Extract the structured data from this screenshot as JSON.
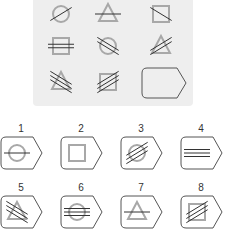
{
  "puzzle": {
    "type": "matrix-reasoning",
    "grid": [
      {
        "shape": "circle",
        "lines": 1,
        "angle": "diagonal-up"
      },
      {
        "shape": "triangle",
        "lines": 1,
        "angle": "horizontal"
      },
      {
        "shape": "square",
        "lines": 1,
        "angle": "diagonal-down"
      },
      {
        "shape": "square",
        "lines": 2,
        "angle": "horizontal"
      },
      {
        "shape": "circle",
        "lines": 2,
        "angle": "diagonal-down"
      },
      {
        "shape": "triangle",
        "lines": 2,
        "angle": "diagonal-up"
      },
      {
        "shape": "triangle",
        "lines": 3,
        "angle": "diagonal-down"
      },
      {
        "shape": "square",
        "lines": 3,
        "angle": "diagonal-up"
      },
      {
        "shape": "missing",
        "lines": 0,
        "angle": "none"
      }
    ],
    "options": [
      {
        "label": "1",
        "shape": "circle",
        "lines": 1,
        "angle": "horizontal"
      },
      {
        "label": "2",
        "shape": "square",
        "lines": 0,
        "angle": "none"
      },
      {
        "label": "3",
        "shape": "circle",
        "lines": 3,
        "angle": "diagonal-up"
      },
      {
        "label": "4",
        "shape": "none",
        "lines": 3,
        "angle": "horizontal"
      },
      {
        "label": "5",
        "shape": "triangle",
        "lines": 3,
        "angle": "diagonal-down"
      },
      {
        "label": "6",
        "shape": "circle",
        "lines": 3,
        "angle": "horizontal"
      },
      {
        "label": "7",
        "shape": "triangle",
        "lines": 1,
        "angle": "horizontal"
      },
      {
        "label": "8",
        "shape": "square",
        "lines": 3,
        "angle": "diagonal-up"
      }
    ]
  },
  "colors": {
    "panel": "#eeeeee",
    "shape_stroke": "#a8a8a8",
    "line_stroke": "#333333",
    "tag_stroke": "#555555"
  }
}
